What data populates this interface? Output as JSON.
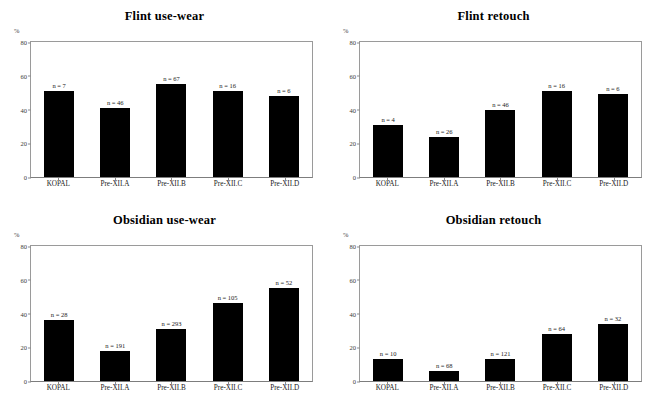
{
  "figure": {
    "axis_unit_label": "%",
    "yticks": [
      0,
      20,
      40,
      60,
      80
    ],
    "ylim": [
      0,
      80
    ],
    "categories": [
      "KOPAL",
      "Pre-XII.A",
      "Pre-XII.B",
      "Pre-XII.C",
      "Pre-XII.D"
    ]
  },
  "chart_data": [
    {
      "type": "bar",
      "panel": "top-left",
      "title": "Flint use-wear",
      "xlabel": "",
      "ylabel": "%",
      "ylim": [
        0,
        80
      ],
      "yticks": [
        0,
        20,
        40,
        60,
        80
      ],
      "grid": false,
      "legend": "none",
      "categories": [
        "KOPAL",
        "Pre-XII.A",
        "Pre-XII.B",
        "Pre-XII.C",
        "Pre-XII.D"
      ],
      "values": [
        51,
        41,
        55,
        51,
        48
      ],
      "annotations": [
        "n = 7",
        "n = 46",
        "n = 67",
        "n = 16",
        "n = 6"
      ],
      "sample_sizes": [
        7,
        46,
        67,
        16,
        6
      ]
    },
    {
      "type": "bar",
      "panel": "top-right",
      "title": "Flint retouch",
      "xlabel": "",
      "ylabel": "%",
      "ylim": [
        0,
        80
      ],
      "yticks": [
        0,
        20,
        40,
        60,
        80
      ],
      "grid": false,
      "legend": "none",
      "categories": [
        "KOPAL",
        "Pre-XII.A",
        "Pre-XII.B",
        "Pre-XII.C",
        "Pre-XII.D"
      ],
      "values": [
        31,
        24,
        40,
        51,
        49
      ],
      "annotations": [
        "n = 4",
        "n = 26",
        "n = 46",
        "n = 16",
        "n = 6"
      ],
      "sample_sizes": [
        4,
        26,
        46,
        16,
        6
      ]
    },
    {
      "type": "bar",
      "panel": "bottom-left",
      "title": "Obsidian use-wear",
      "xlabel": "",
      "ylabel": "%",
      "ylim": [
        0,
        80
      ],
      "yticks": [
        0,
        20,
        40,
        60,
        80
      ],
      "grid": false,
      "legend": "none",
      "categories": [
        "KOPAL",
        "Pre-XII.A",
        "Pre-XII.B",
        "Pre-XII.C",
        "Pre-XII.D"
      ],
      "values": [
        36,
        18,
        31,
        46,
        55
      ],
      "annotations": [
        "n = 28",
        "n = 191",
        "n = 293",
        "n = 105",
        "n = 52"
      ],
      "sample_sizes": [
        28,
        191,
        293,
        105,
        52
      ]
    },
    {
      "type": "bar",
      "panel": "bottom-right",
      "title": "Obsidian retouch",
      "xlabel": "",
      "ylabel": "%",
      "ylim": [
        0,
        80
      ],
      "yticks": [
        0,
        20,
        40,
        60,
        80
      ],
      "grid": false,
      "legend": "none",
      "categories": [
        "KOPAL",
        "Pre-XII.A",
        "Pre-XII.B",
        "Pre-XII.C",
        "Pre-XII.D"
      ],
      "values": [
        13,
        6,
        13,
        28,
        34
      ],
      "annotations": [
        "n = 10",
        "n = 68",
        "n = 121",
        "n = 64",
        "n = 32"
      ],
      "sample_sizes": [
        10,
        68,
        121,
        64,
        32
      ]
    }
  ],
  "colors": {
    "bar": "#000000",
    "frame": "#9a9a9a",
    "text": "#000000",
    "background": "#ffffff"
  }
}
